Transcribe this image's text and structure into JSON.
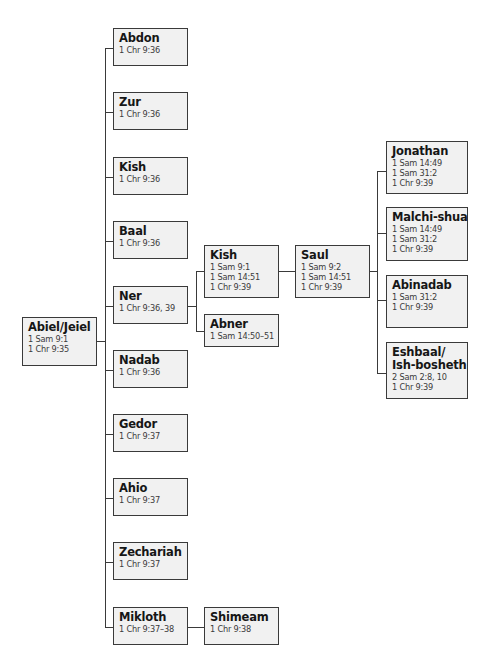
{
  "diagram": {
    "type": "family-tree",
    "root": {
      "name": "Abiel/Jeiel",
      "refs": [
        "1 Sam 9:1",
        "1 Chr 9:35"
      ]
    },
    "children_of_root": [
      {
        "name": "Abdon",
        "refs": [
          "1 Chr 9:36"
        ]
      },
      {
        "name": "Zur",
        "refs": [
          "1 Chr 9:36"
        ]
      },
      {
        "name": "Kish",
        "refs": [
          "1 Chr 9:36"
        ]
      },
      {
        "name": "Baal",
        "refs": [
          "1 Chr 9:36"
        ]
      },
      {
        "name": "Ner",
        "refs": [
          "1 Chr 9:36, 39"
        ]
      },
      {
        "name": "Nadab",
        "refs": [
          "1 Chr 9:36"
        ]
      },
      {
        "name": "Gedor",
        "refs": [
          "1 Chr 9:37"
        ]
      },
      {
        "name": "Ahio",
        "refs": [
          "1 Chr 9:37"
        ]
      },
      {
        "name": "Zechariah",
        "refs": [
          "1 Chr 9:37"
        ]
      },
      {
        "name": "Mikloth",
        "refs": [
          "1 Chr 9:37–38"
        ]
      }
    ],
    "children_of_ner": [
      {
        "name": "Kish",
        "refs": [
          "1 Sam 9:1",
          "1 Sam 14:51",
          "1 Chr 9:39"
        ]
      },
      {
        "name": "Abner",
        "refs": [
          "1 Sam 14:50–51"
        ]
      }
    ],
    "children_of_mikloth": [
      {
        "name": "Shimeam",
        "refs": [
          "1 Chr 9:38"
        ]
      }
    ],
    "children_of_kish": [
      {
        "name": "Saul",
        "refs": [
          "1 Sam 9:2",
          "1 Sam 14:51",
          "1 Chr 9:39"
        ]
      }
    ],
    "children_of_saul": [
      {
        "name": "Jonathan",
        "refs": [
          "1 Sam 14:49",
          "1 Sam 31:2",
          "1 Chr 9:39"
        ]
      },
      {
        "name": "Malchi-shua",
        "refs": [
          "1 Sam 14:49",
          "1 Sam 31:2",
          "1 Chr 9:39"
        ]
      },
      {
        "name": "Abinadab",
        "refs": [
          "1 Sam 31:2",
          "1 Chr 9:39"
        ]
      },
      {
        "name": "Eshbaal/",
        "name2": "Ish-bosheth",
        "refs": [
          "2 Sam 2:8, 10",
          "1 Chr 9:39"
        ]
      }
    ]
  }
}
